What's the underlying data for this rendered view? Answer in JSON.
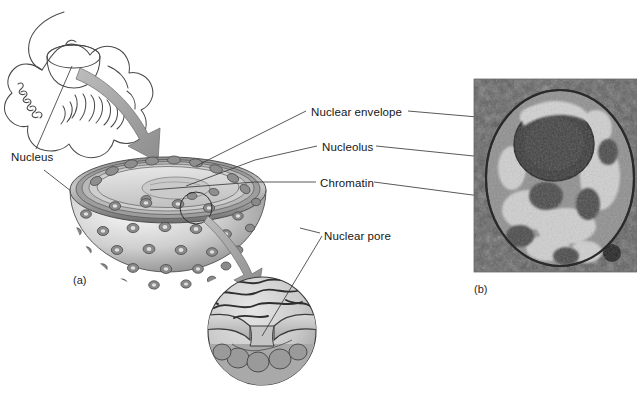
{
  "figure": {
    "labels": {
      "nucleus": "Nucleus",
      "nuclear_envelope": "Nuclear envelope",
      "nucleolus": "Nucleolus",
      "chromatin": "Chromatin",
      "nuclear_pore": "Nuclear pore"
    },
    "panels": {
      "a": "(a)",
      "b": "(b)"
    },
    "colors": {
      "background": "#ffffff",
      "line": "#333333",
      "text": "#161616",
      "arrow_fill": "#a8a8a8",
      "arrow_stroke": "#6e6e6e",
      "envelope_dark": "#5e5e5e",
      "envelope_mid": "#8d8d8d",
      "nucleoplasm_light": "#d8d8d8",
      "sphere_light": "#e2e2e2",
      "sphere_mid": "#b4b4b4",
      "micrograph_dark": "#3a3a3a",
      "micrograph_light": "#d0d0d0"
    }
  }
}
